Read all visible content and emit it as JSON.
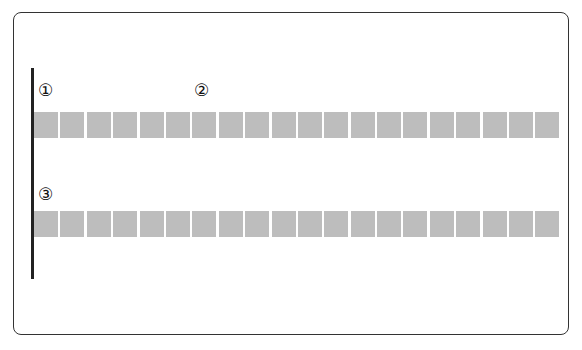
{
  "diagram": {
    "labels": [
      {
        "id": "1",
        "text": "①"
      },
      {
        "id": "2",
        "text": "②"
      },
      {
        "id": "3",
        "text": "③"
      }
    ],
    "rows": [
      {
        "name": "row-1",
        "cell_count": 20,
        "cell_color": "#bdbdbd"
      },
      {
        "name": "row-2",
        "cell_count": 20,
        "cell_color": "#bdbdbd"
      }
    ],
    "colors": {
      "frame": "#333333",
      "vertical_line": "#222222",
      "cells": "#bdbdbd",
      "background": "#ffffff"
    }
  }
}
